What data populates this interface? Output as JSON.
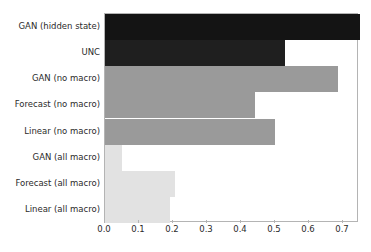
{
  "chart_data": {
    "type": "bar",
    "orientation": "horizontal",
    "title": "",
    "xlabel": "",
    "ylabel": "",
    "categories": [
      "GAN (hidden state)",
      "UNC",
      "GAN (no macro)",
      "Forecast (no macro)",
      "Linear (no macro)",
      "GAN (all macro)",
      "Forecast (all macro)",
      "Linear (all macro)"
    ],
    "values": [
      0.75,
      0.53,
      0.685,
      0.44,
      0.5,
      0.05,
      0.205,
      0.19
    ],
    "bar_colors": [
      "#141414",
      "#1f1f1f",
      "#9a9a9a",
      "#9a9a9a",
      "#9a9a9a",
      "#e2e2e2",
      "#e2e2e2",
      "#e2e2e2"
    ],
    "xlim": [
      0.0,
      0.747
    ],
    "ylim": [
      0,
      8
    ],
    "xticks": [
      0.0,
      0.1,
      0.2,
      0.3,
      0.4,
      0.5,
      0.6,
      0.7
    ],
    "xtick_labels": [
      "0.0",
      "0.1",
      "0.2",
      "0.3",
      "0.4",
      "0.5",
      "0.6",
      "0.7"
    ],
    "grid": false,
    "legend": null,
    "frame_color": "#b4b4b4",
    "background_color": "#ffffff",
    "text_color": "#2b2b2b"
  }
}
